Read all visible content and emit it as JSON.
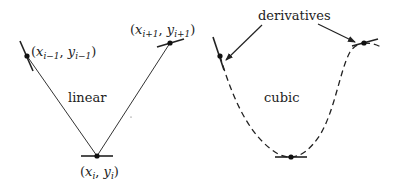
{
  "diagram": {
    "colors": {
      "stroke": "#222222",
      "background": "#ffffff"
    },
    "linear_panel": {
      "label": "linear",
      "points": [
        {
          "name": "prev",
          "x": "x",
          "sub_x": "i−1",
          "y": "y",
          "sub_y": "i−1"
        },
        {
          "name": "curr",
          "x": "x",
          "sub_x": "i",
          "y": "y",
          "sub_y": "i"
        },
        {
          "name": "next",
          "x": "x",
          "sub_x": "i+1",
          "y": "y",
          "sub_y": "i+1"
        }
      ]
    },
    "cubic_panel": {
      "label": "cubic",
      "annotation": "derivatives"
    },
    "punct": {
      "open": "(",
      "comma": ", ",
      "close": ")"
    }
  }
}
